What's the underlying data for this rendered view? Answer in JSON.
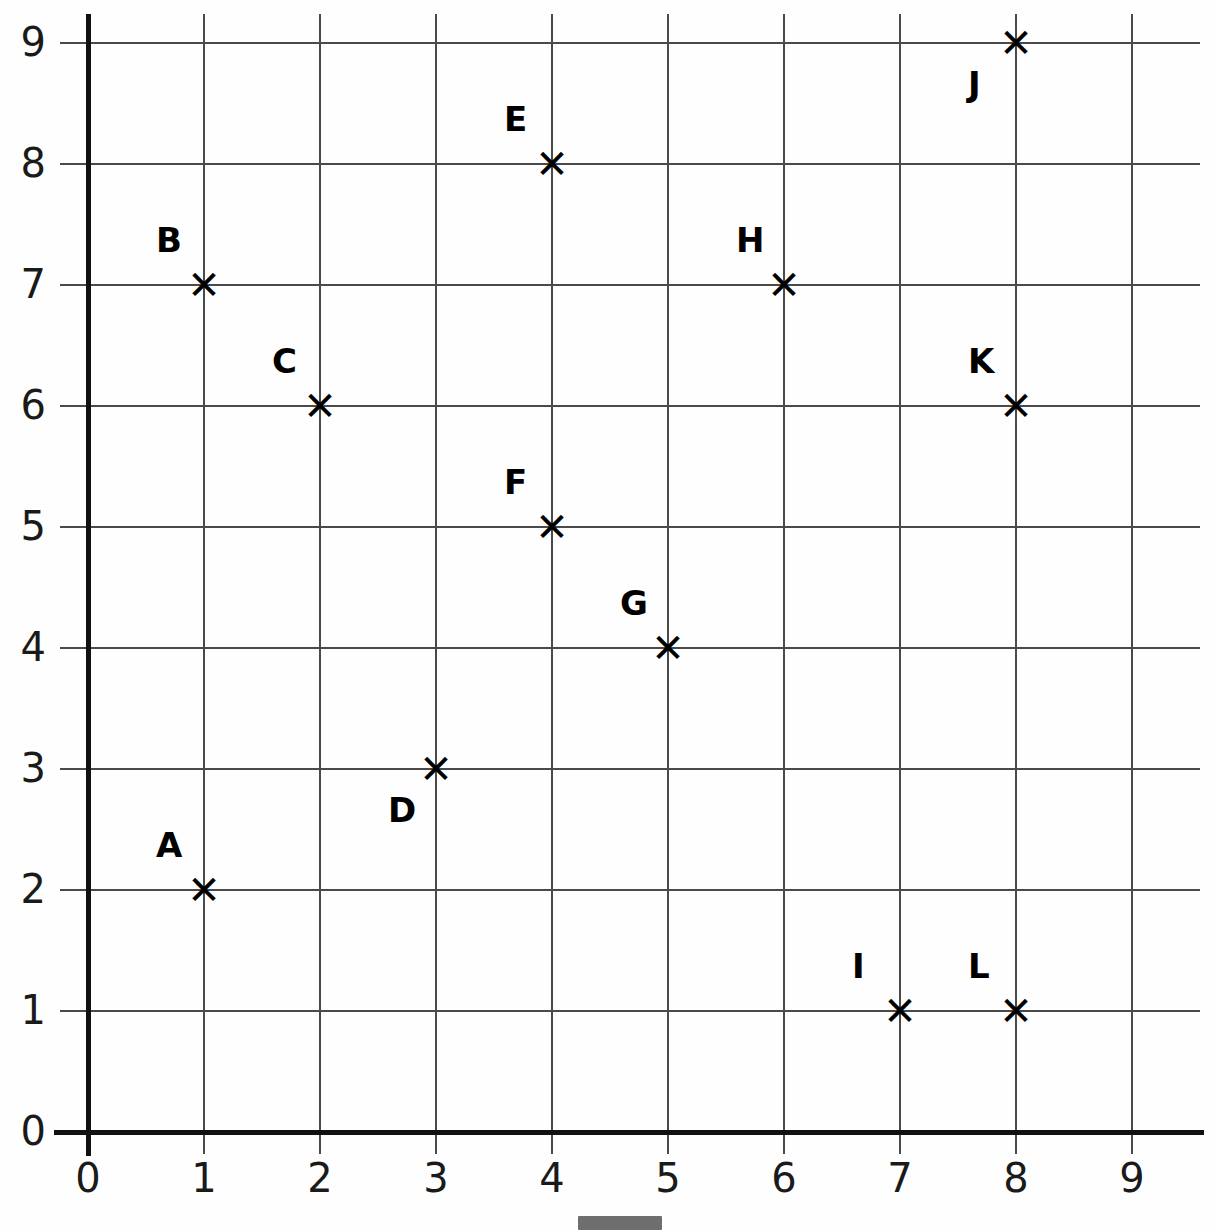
{
  "chart_data": {
    "type": "scatter",
    "title": "",
    "xlabel": "",
    "ylabel": "",
    "xlim": [
      0,
      9
    ],
    "ylim": [
      0,
      9
    ],
    "grid": true,
    "legend": "none",
    "marker": "x",
    "x_ticks": [
      "0",
      "1",
      "2",
      "3",
      "4",
      "5",
      "6",
      "7",
      "8",
      "9"
    ],
    "y_ticks": [
      "0",
      "1",
      "2",
      "3",
      "4",
      "5",
      "6",
      "7",
      "8",
      "9"
    ],
    "points": [
      {
        "label": "A",
        "x": 1,
        "y": 2,
        "label_position": "above-left"
      },
      {
        "label": "B",
        "x": 1,
        "y": 7,
        "label_position": "above-left"
      },
      {
        "label": "C",
        "x": 2,
        "y": 6,
        "label_position": "above-left"
      },
      {
        "label": "D",
        "x": 3,
        "y": 3,
        "label_position": "below-left"
      },
      {
        "label": "E",
        "x": 4,
        "y": 8,
        "label_position": "above-left"
      },
      {
        "label": "F",
        "x": 4,
        "y": 5,
        "label_position": "above-left"
      },
      {
        "label": "G",
        "x": 5,
        "y": 4,
        "label_position": "above-left"
      },
      {
        "label": "H",
        "x": 6,
        "y": 7,
        "label_position": "above-left"
      },
      {
        "label": "I",
        "x": 7,
        "y": 1,
        "label_position": "above-left"
      },
      {
        "label": "J",
        "x": 8,
        "y": 9,
        "label_position": "below-left"
      },
      {
        "label": "K",
        "x": 8,
        "y": 6,
        "label_position": "above-left"
      },
      {
        "label": "L",
        "x": 8,
        "y": 1,
        "label_position": "above-left"
      }
    ],
    "marker_glyph": "✕",
    "colors": {
      "axis": "#111111",
      "gridline": "#4a4a4a",
      "marker": "#000000",
      "label": "#000000",
      "background": "#fefefe"
    }
  }
}
